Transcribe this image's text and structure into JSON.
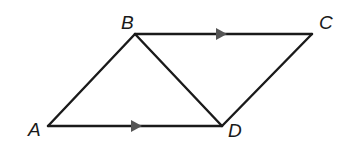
{
  "diagram": {
    "type": "parallelogram with diagonal",
    "points": {
      "A": {
        "label": "A",
        "x": 48,
        "y": 126
      },
      "B": {
        "label": "B",
        "x": 135,
        "y": 34
      },
      "C": {
        "label": "C",
        "x": 312,
        "y": 34
      },
      "D": {
        "label": "D",
        "x": 222,
        "y": 126
      }
    },
    "segments": [
      "AB",
      "BC",
      "CD",
      "DA",
      "BD"
    ],
    "parallel_marks": [
      "BC",
      "AD"
    ],
    "colors": {
      "line": "#1a1a1a",
      "arrow": "#555555"
    }
  }
}
